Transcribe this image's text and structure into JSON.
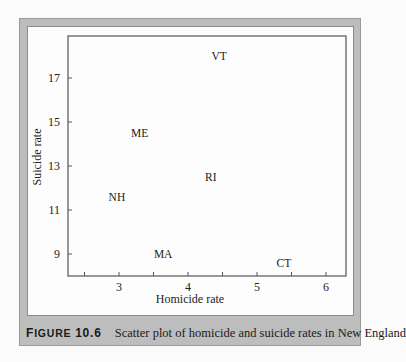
{
  "figure": {
    "label_first": "F",
    "label_rest": "IGURE",
    "number": "10.6",
    "caption": "Scatter plot of homicide and suicide rates in New England"
  },
  "colors": {
    "frame": "#bdbdbd",
    "panel": "#fdfdfd",
    "axis": "#555555",
    "text": "#222222"
  },
  "chart_data": {
    "type": "scatter",
    "title": "Scatter plot of homicide and suicide rates in New England",
    "xlabel": "Homicide rate",
    "ylabel": "Suicide rate",
    "xlim": [
      2.27,
      6.3
    ],
    "ylim": [
      8.1,
      18.9
    ],
    "x_ticks": [
      2.5,
      3,
      3.5,
      4,
      4.5,
      5,
      5.5,
      6
    ],
    "x_tick_labels": [
      "",
      "3",
      "",
      "4",
      "",
      "5",
      "",
      "6"
    ],
    "y_ticks": [
      9,
      11,
      13,
      15,
      17
    ],
    "y_tick_labels": [
      "9",
      "11",
      "13",
      "15",
      "17"
    ],
    "grid": false,
    "legend": null,
    "marker": "state abbreviation text",
    "points": [
      {
        "label": "VT",
        "x": 4.45,
        "y": 18.0
      },
      {
        "label": "ME",
        "x": 3.3,
        "y": 14.5
      },
      {
        "label": "RI",
        "x": 4.33,
        "y": 12.5
      },
      {
        "label": "NH",
        "x": 2.97,
        "y": 11.6
      },
      {
        "label": "MA",
        "x": 3.64,
        "y": 9.0
      },
      {
        "label": "CT",
        "x": 5.39,
        "y": 8.6
      }
    ]
  }
}
